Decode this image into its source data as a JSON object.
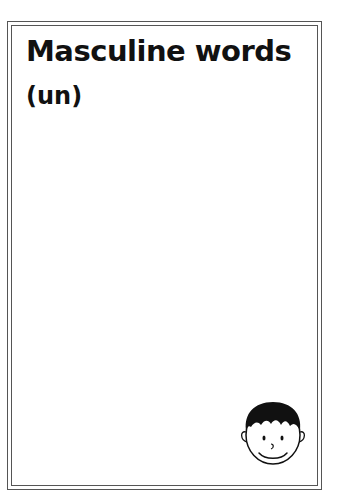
{
  "page": {
    "title": "Masculine words",
    "subtitle": "(un)"
  },
  "decoration": {
    "icon": "boy-face-icon",
    "border": "double-line-frame"
  },
  "colors": {
    "ink": "#111111",
    "border": "#555555",
    "background": "#ffffff"
  }
}
